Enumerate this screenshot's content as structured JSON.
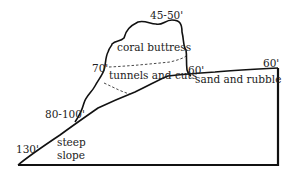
{
  "diagram": {
    "labels": {
      "top_depth": "45-50'",
      "coral_buttress": "coral buttress",
      "depth_70": "70'",
      "tunnels": "tunnels and cuts",
      "depth_60_mid": "60'",
      "depth_60_right": "60'",
      "sand": "sand and rubble",
      "depth_80_100": "80-100'",
      "depth_130": "130'",
      "steep": "steep",
      "slope": "slope"
    },
    "colors": {
      "line": "#111111",
      "text": "#222222",
      "background": "#ffffff"
    }
  }
}
